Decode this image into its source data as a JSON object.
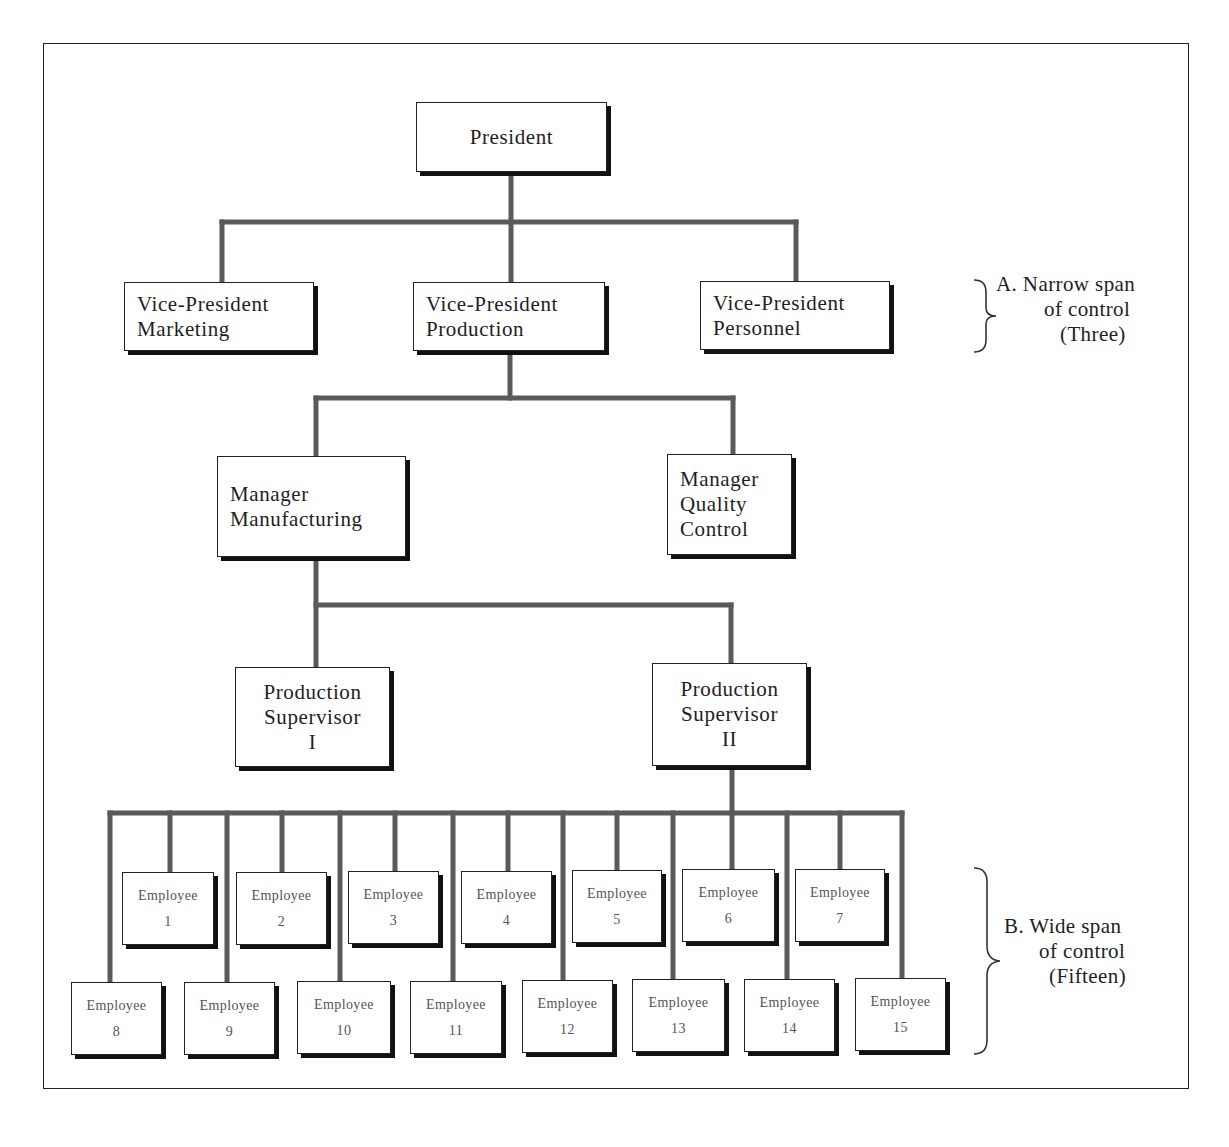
{
  "diagram": {
    "type": "org-chart",
    "line_color": "#5a5a5a",
    "box_border_color": "#222222"
  },
  "nodes": {
    "president": {
      "lines": [
        "President"
      ]
    },
    "vp_marketing": {
      "lines": [
        "Vice-President",
        "Marketing"
      ]
    },
    "vp_production": {
      "lines": [
        "Vice-President",
        "Production"
      ]
    },
    "vp_personnel": {
      "lines": [
        "Vice-President",
        "Personnel"
      ]
    },
    "mgr_manufacturing": {
      "lines": [
        "Manager",
        "Manufacturing"
      ]
    },
    "mgr_quality": {
      "lines": [
        "Manager",
        "Quality",
        "Control"
      ]
    },
    "supervisor_1": {
      "lines": [
        "Production",
        "Supervisor",
        "I"
      ]
    },
    "supervisor_2": {
      "lines": [
        "Production",
        "Supervisor",
        "II"
      ]
    }
  },
  "employees": [
    {
      "label": "Employee",
      "number": "1"
    },
    {
      "label": "Employee",
      "number": "2"
    },
    {
      "label": "Employee",
      "number": "3"
    },
    {
      "label": "Employee",
      "number": "4"
    },
    {
      "label": "Employee",
      "number": "5"
    },
    {
      "label": "Employee",
      "number": "6"
    },
    {
      "label": "Employee",
      "number": "7"
    },
    {
      "label": "Employee",
      "number": "8"
    },
    {
      "label": "Employee",
      "number": "9"
    },
    {
      "label": "Employee",
      "number": "10"
    },
    {
      "label": "Employee",
      "number": "11"
    },
    {
      "label": "Employee",
      "number": "12"
    },
    {
      "label": "Employee",
      "number": "13"
    },
    {
      "label": "Employee",
      "number": "14"
    },
    {
      "label": "Employee",
      "number": "15"
    }
  ],
  "annotations": {
    "narrow": {
      "lines": [
        "A. Narrow span",
        "of control",
        "(Three)"
      ]
    },
    "wide": {
      "lines": [
        "B. Wide span",
        "of control",
        "(Fifteen)"
      ]
    }
  },
  "edges": [
    [
      "President",
      "Vice-President Marketing"
    ],
    [
      "President",
      "Vice-President Production"
    ],
    [
      "President",
      "Vice-President Personnel"
    ],
    [
      "Vice-President Production",
      "Manager Manufacturing"
    ],
    [
      "Vice-President Production",
      "Manager Quality Control"
    ],
    [
      "Manager Manufacturing",
      "Production Supervisor I"
    ],
    [
      "Manager Manufacturing",
      "Production Supervisor II"
    ],
    [
      "Production Supervisor II",
      "Employee 1..15"
    ]
  ]
}
